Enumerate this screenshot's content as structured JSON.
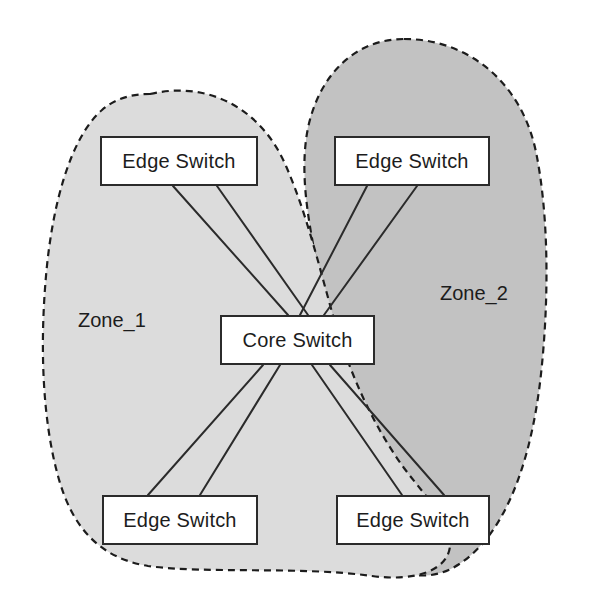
{
  "diagram": {
    "canvas": {
      "width": 593,
      "height": 607
    },
    "background_color": "#ffffff"
  },
  "zones": [
    {
      "id": "zone-1",
      "label": "Zone_1",
      "fill_color": "#dcdcdc",
      "border_color": "#1c1c1c",
      "border_style": "dashed",
      "label_position": {
        "x": 78,
        "y": 309
      }
    },
    {
      "id": "zone-2",
      "label": "Zone_2",
      "fill_color": "#c2c2c2",
      "border_color": "#1c1c1c",
      "border_style": "dashed",
      "label_position": {
        "x": 440,
        "y": 282
      }
    }
  ],
  "nodes": [
    {
      "id": "edge-switch-top-left",
      "label": "Edge Switch",
      "zone": "Zone_1",
      "box": {
        "x": 100,
        "y": 136,
        "width": 158,
        "height": 50
      }
    },
    {
      "id": "edge-switch-top-right",
      "label": "Edge Switch",
      "zone": "Zone_2",
      "box": {
        "x": 334,
        "y": 136,
        "width": 156,
        "height": 50
      }
    },
    {
      "id": "core-switch",
      "label": "Core Switch",
      "zone": "Zone_1",
      "box": {
        "x": 220,
        "y": 315,
        "width": 155,
        "height": 50
      }
    },
    {
      "id": "edge-switch-bottom-left",
      "label": "Edge Switch",
      "zone": "Zone_1",
      "box": {
        "x": 102,
        "y": 495,
        "width": 156,
        "height": 50
      }
    },
    {
      "id": "edge-switch-bottom-right",
      "label": "Edge Switch",
      "zone": "Zone_2",
      "box": {
        "x": 336,
        "y": 495,
        "width": 154,
        "height": 50
      }
    }
  ],
  "links": [
    {
      "id": "link-tl-core-a",
      "from": "edge-switch-top-left",
      "to": "core-switch",
      "x1": 173,
      "y1": 186,
      "x2": 288,
      "y2": 315
    },
    {
      "id": "link-tl-core-b",
      "from": "edge-switch-top-left",
      "to": "core-switch",
      "x1": 217,
      "y1": 186,
      "x2": 308,
      "y2": 315
    },
    {
      "id": "link-tr-core-a",
      "from": "edge-switch-top-right",
      "to": "core-switch",
      "x1": 367,
      "y1": 186,
      "x2": 300,
      "y2": 315
    },
    {
      "id": "link-tr-core-b",
      "from": "edge-switch-top-right",
      "to": "core-switch",
      "x1": 417,
      "y1": 186,
      "x2": 324,
      "y2": 315
    },
    {
      "id": "link-core-bl-a",
      "from": "core-switch",
      "to": "edge-switch-bottom-left",
      "x1": 263,
      "y1": 365,
      "x2": 148,
      "y2": 495
    },
    {
      "id": "link-core-bl-b",
      "from": "core-switch",
      "to": "edge-switch-bottom-left",
      "x1": 280,
      "y1": 365,
      "x2": 200,
      "y2": 495
    },
    {
      "id": "link-core-br-a",
      "from": "core-switch",
      "to": "edge-switch-bottom-right",
      "x1": 312,
      "y1": 365,
      "x2": 402,
      "y2": 495
    },
    {
      "id": "link-core-br-b",
      "from": "core-switch",
      "to": "edge-switch-bottom-right",
      "x1": 330,
      "y1": 365,
      "x2": 444,
      "y2": 495
    }
  ],
  "style": {
    "link_color": "#2b2b2b",
    "link_width": 2,
    "node_border_color": "#2b2b2b",
    "node_fill_color": "#ffffff",
    "text_color": "#1c1c1c"
  }
}
